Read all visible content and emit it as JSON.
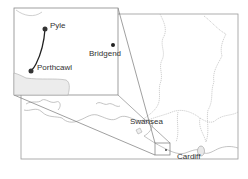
{
  "map": {
    "colors": {
      "frame": "#999999",
      "coast": "#aaaaaa",
      "boundary": "#bbbbbb",
      "route": "#222222",
      "marker": "#222222",
      "land_fill": "#f0f0f0"
    },
    "inset": {
      "places": [
        {
          "name": "Pyle",
          "type": "route-point"
        },
        {
          "name": "Porthcawl",
          "type": "route-point"
        },
        {
          "name": "Bridgend",
          "type": "town"
        }
      ]
    },
    "main": {
      "places": [
        {
          "name": "Swansea"
        },
        {
          "name": "Cardiff"
        }
      ]
    }
  }
}
